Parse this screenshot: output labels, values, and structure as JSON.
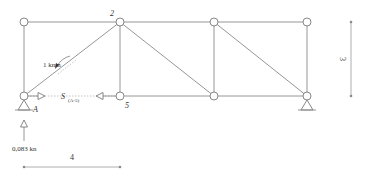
{
  "diagram": {
    "type": "truss",
    "nodes": [
      {
        "id": "top-1",
        "x": 24,
        "y": 22,
        "label": ""
      },
      {
        "id": "2",
        "x": 120,
        "y": 22,
        "label": "2"
      },
      {
        "id": "top-3",
        "x": 214,
        "y": 22,
        "label": ""
      },
      {
        "id": "top-4",
        "x": 307,
        "y": 22,
        "label": ""
      },
      {
        "id": "A",
        "x": 24,
        "y": 96,
        "label": "A"
      },
      {
        "id": "5",
        "x": 120,
        "y": 96,
        "label": "5"
      },
      {
        "id": "bot-3",
        "x": 214,
        "y": 96,
        "label": ""
      },
      {
        "id": "bot-4",
        "x": 307,
        "y": 96,
        "label": ""
      }
    ],
    "labels": {
      "node_2": "2",
      "node_A": "A",
      "node_5": "5",
      "moment": "1 knm",
      "member_force_S": "S",
      "member_force_sub": "(A-5)",
      "reaction": "0,083 kn",
      "dim_width": "4",
      "dim_height": "3"
    }
  }
}
